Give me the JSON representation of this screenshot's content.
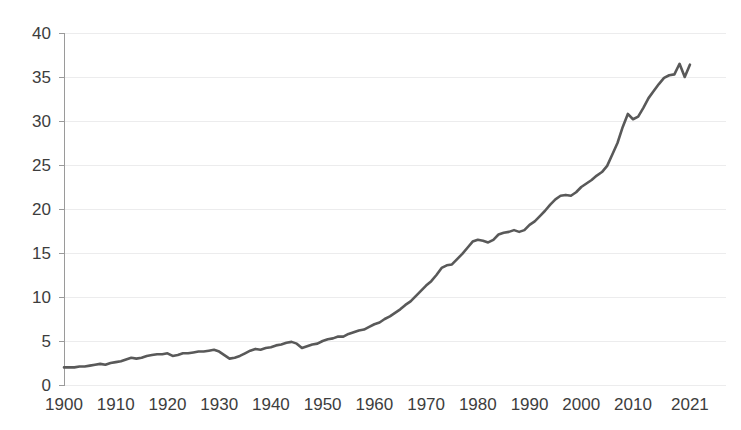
{
  "chart_data": {
    "type": "line",
    "title": "",
    "subtitle": "",
    "xlabel": "",
    "ylabel": "",
    "xlim": [
      1900,
      2021
    ],
    "ylim": [
      0,
      40
    ],
    "grid": true,
    "legend": "none",
    "line_color": "#595959",
    "gridline_color": "#ececed",
    "axis_color": "#9a9a9a",
    "label_color": "#3d3d3d",
    "background_color": "#ffffff",
    "y_ticks": [
      0,
      5,
      10,
      15,
      20,
      25,
      30,
      35,
      40
    ],
    "y_tick_labels": [
      "0",
      "5",
      "10",
      "15",
      "20",
      "25",
      "30",
      "35",
      "40"
    ],
    "x_ticks": [
      1900,
      1910,
      1920,
      1930,
      1940,
      1950,
      1960,
      1970,
      1980,
      1990,
      2000,
      2010,
      2021
    ],
    "x_tick_labels": [
      "1900",
      "1910",
      "1920",
      "1930",
      "1940",
      "1950",
      "1960",
      "1970",
      "1980",
      "1990",
      "2000",
      "2010",
      "2021"
    ],
    "series": [
      {
        "name": "series-1",
        "x": [
          1900,
          1901,
          1902,
          1903,
          1904,
          1905,
          1906,
          1907,
          1908,
          1909,
          1910,
          1911,
          1912,
          1913,
          1914,
          1915,
          1916,
          1917,
          1918,
          1919,
          1920,
          1921,
          1922,
          1923,
          1924,
          1925,
          1926,
          1927,
          1928,
          1929,
          1930,
          1931,
          1932,
          1933,
          1934,
          1935,
          1936,
          1937,
          1938,
          1939,
          1940,
          1941,
          1942,
          1943,
          1944,
          1945,
          1946,
          1947,
          1948,
          1949,
          1950,
          1951,
          1952,
          1953,
          1954,
          1955,
          1956,
          1957,
          1958,
          1959,
          1960,
          1961,
          1962,
          1963,
          1964,
          1965,
          1966,
          1967,
          1968,
          1969,
          1970,
          1971,
          1972,
          1973,
          1974,
          1975,
          1976,
          1977,
          1978,
          1979,
          1980,
          1981,
          1982,
          1983,
          1984,
          1985,
          1986,
          1987,
          1988,
          1989,
          1990,
          1991,
          1992,
          1993,
          1994,
          1995,
          1996,
          1997,
          1998,
          1999,
          2000,
          2001,
          2002,
          2003,
          2004,
          2005,
          2006,
          2007,
          2008,
          2009,
          2010,
          2011,
          2012,
          2013,
          2014,
          2015,
          2016,
          2017,
          2018,
          2019,
          2020,
          2021
        ],
        "values": [
          2.0,
          2.0,
          2.0,
          2.1,
          2.1,
          2.2,
          2.3,
          2.4,
          2.3,
          2.5,
          2.6,
          2.7,
          2.9,
          3.1,
          3.0,
          3.1,
          3.3,
          3.4,
          3.5,
          3.5,
          3.6,
          3.3,
          3.4,
          3.6,
          3.6,
          3.7,
          3.8,
          3.8,
          3.9,
          4.0,
          3.8,
          3.4,
          3.0,
          3.1,
          3.3,
          3.6,
          3.9,
          4.1,
          4.0,
          4.2,
          4.3,
          4.5,
          4.6,
          4.8,
          4.9,
          4.7,
          4.2,
          4.4,
          4.6,
          4.7,
          5.0,
          5.2,
          5.3,
          5.5,
          5.5,
          5.8,
          6.0,
          6.2,
          6.3,
          6.6,
          6.9,
          7.1,
          7.5,
          7.8,
          8.2,
          8.6,
          9.1,
          9.5,
          10.1,
          10.7,
          11.3,
          11.8,
          12.5,
          13.3,
          13.6,
          13.7,
          14.3,
          14.9,
          15.6,
          16.3,
          16.5,
          16.4,
          16.2,
          16.5,
          17.1,
          17.3,
          17.4,
          17.6,
          17.4,
          17.6,
          18.2,
          18.6,
          19.2,
          19.8,
          20.5,
          21.1,
          21.5,
          21.6,
          21.5,
          21.9,
          22.5,
          22.9,
          23.3,
          23.8,
          24.2,
          24.9,
          26.2,
          27.5,
          29.3,
          30.8,
          30.2,
          30.5,
          31.5,
          32.6,
          33.4,
          34.2,
          34.9,
          35.2,
          35.3,
          36.5,
          35.0,
          36.4
        ]
      }
    ]
  },
  "accessibility": {
    "chart_role": "line chart",
    "series_count": "1"
  }
}
